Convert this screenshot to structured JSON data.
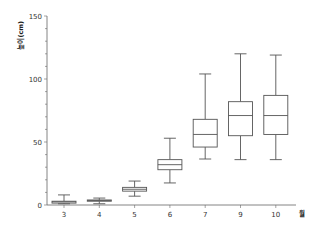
{
  "chart_data": {
    "type": "box",
    "title": "",
    "xlabel": "월",
    "ylabel": "높이(cm)",
    "ylim": [
      0,
      150
    ],
    "yticks": [
      0,
      50,
      100,
      150
    ],
    "grid": false,
    "legend": null,
    "categories": [
      "3",
      "4",
      "5",
      "6",
      "7",
      "9",
      "10"
    ],
    "boxes": [
      {
        "category": "3",
        "whisker_low": 1,
        "q1": 1.5,
        "median": 2.5,
        "q3": 3,
        "whisker_high": 8
      },
      {
        "category": "4",
        "whisker_low": 1,
        "q1": 3,
        "median": 3.5,
        "q3": 4,
        "whisker_high": 5.5
      },
      {
        "category": "5",
        "whisker_low": 7,
        "q1": 11,
        "median": 12.5,
        "q3": 14,
        "whisker_high": 19
      },
      {
        "category": "6",
        "whisker_low": 17.5,
        "q1": 28,
        "median": 32,
        "q3": 36,
        "whisker_high": 53
      },
      {
        "category": "7",
        "whisker_low": 36.5,
        "q1": 46,
        "median": 56,
        "q3": 68,
        "whisker_high": 104
      },
      {
        "category": "9",
        "whisker_low": 36,
        "q1": 55,
        "median": 71,
        "q3": 82,
        "whisker_high": 120
      },
      {
        "category": "10",
        "whisker_low": 36,
        "q1": 56,
        "median": 71,
        "q3": 87,
        "whisker_high": 119
      }
    ]
  },
  "colors": {
    "line": "#555555",
    "axis": "#666666"
  }
}
